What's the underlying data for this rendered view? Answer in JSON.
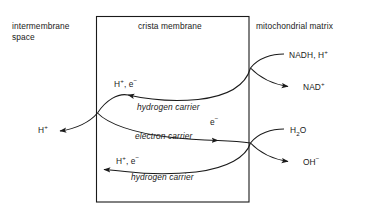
{
  "diagram": {
    "type": "biology-process-diagram",
    "stroke_color": "#1a1a1a",
    "text_color": "#1a1a1a",
    "background_color": "#ffffff",
    "regions": [
      {
        "id": "intermembrane",
        "label_line1": "intermembrane",
        "label_line2": "space"
      },
      {
        "id": "crista",
        "label": "crista membrane"
      },
      {
        "id": "matrix",
        "label": "mitochondrial matrix"
      }
    ],
    "membrane_box": {
      "name": "crista-membrane-box",
      "left": 96,
      "top": 16,
      "right": 249,
      "bottom": 202
    },
    "carriers": [
      {
        "id": "hydrogen-carrier-top",
        "label": "hydrogen carrier",
        "direction": "leftward"
      },
      {
        "id": "electron-carrier",
        "label": "electron carrier",
        "direction": "rightward"
      },
      {
        "id": "hydrogen-carrier-bottom",
        "label": "hydrogen carrier",
        "direction": "leftward"
      }
    ],
    "species": {
      "h_plus_e_minus_top": {
        "base1": "H",
        "sup1": "+",
        "sep": ", ",
        "base2": "e",
        "sup2": "−"
      },
      "h_plus_e_minus_bottom": {
        "base1": "H",
        "sup1": "+",
        "sep": ", ",
        "base2": "e",
        "sup2": "−"
      },
      "electron": {
        "base": "e",
        "sup": "−"
      },
      "proton_out": {
        "base": "H",
        "sup": "+"
      },
      "nadh": {
        "text": "NADH, H",
        "sup": "+"
      },
      "nad": {
        "text": "NAD",
        "sup": "+"
      },
      "water": {
        "base": "H",
        "sub": "2",
        "tail": "O"
      },
      "hydroxide": {
        "text": "OH",
        "sup": "−"
      }
    }
  }
}
